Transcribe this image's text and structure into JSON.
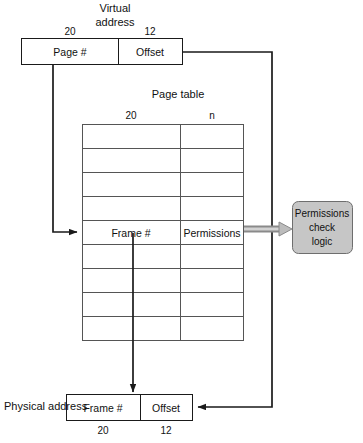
{
  "diagram": {
    "colors": {
      "line": "#1a1a1a",
      "gray_fill": "#c6c6c6",
      "gray_arrow": "#8a8a8a",
      "background": "#ffffff"
    },
    "virtual_address": {
      "caption_line1": "Virtual",
      "caption_line2": "address",
      "bit_left": "20",
      "bit_right": "12",
      "field_left": "Page #",
      "field_right": "Offset"
    },
    "page_table": {
      "caption": "Page table",
      "bit_left": "20",
      "bit_right": "n",
      "row_count": 9,
      "highlighted_row_index": 5,
      "entry_left": "Frame #",
      "entry_right": "Permissions"
    },
    "permissions_logic": {
      "line1": "Permissions",
      "line2": "check",
      "line3": "logic"
    },
    "physical_address": {
      "caption": "Physical address",
      "field_left": "Frame #",
      "field_right": "Offset",
      "bit_left": "20",
      "bit_right": "12"
    }
  }
}
